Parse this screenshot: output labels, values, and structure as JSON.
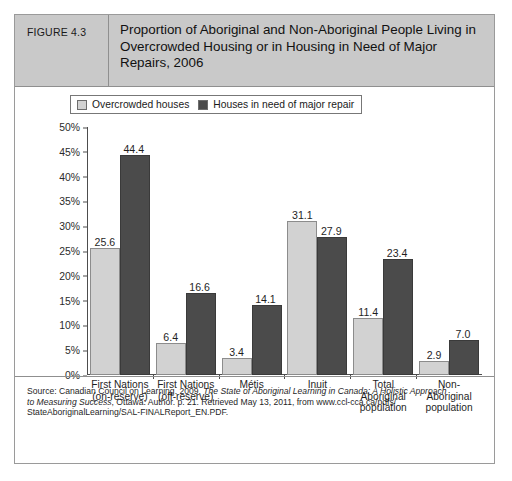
{
  "figure": {
    "number": "FIGURE 4.3",
    "title": "Proportion of Aboriginal and Non-Aboriginal People Living in Overcrowded Housing or in Housing in Need of Major Repairs, 2006"
  },
  "source": {
    "line1_prefix": "Source: Canadian Council on Learning. 2009.",
    "line1_italic": "The State of Aboriginal Learning in Canada: A Holistic Approach",
    "line2_italic": "to Measuring Success",
    "line2_rest": ", Ottawa: Author. p. 21. Retrieved May 13, 2011, from www.ccl-cca.ca/pdfs/",
    "line3": "StateAboriginalLearning/SAL-FINALReport_EN.PDF."
  },
  "colors": {
    "light_bar": "#d2d2d2",
    "dark_bar": "#4b4b4b",
    "header_bg": "#c9c9c9",
    "border": "#9a9a9a",
    "axis": "#4d4d4d"
  },
  "chart_data": {
    "type": "bar",
    "title": "Proportion of Aboriginal and Non-Aboriginal People Living in Overcrowded Housing or in Housing in Need of Major Repairs, 2006",
    "xlabel": "",
    "ylabel": "",
    "ylim": [
      0,
      50
    ],
    "ytick_values": [
      0,
      5,
      10,
      15,
      20,
      25,
      30,
      35,
      40,
      45,
      50
    ],
    "ytick_labels": [
      "0%",
      "5%",
      "10%",
      "15%",
      "20%",
      "25%",
      "30%",
      "35%",
      "40%",
      "45%",
      "50%"
    ],
    "grid": false,
    "legend_position": "top-left",
    "categories": [
      "First Nations (on-reserve)",
      "First Nations (off-reserve)",
      "Métis",
      "Inuit",
      "Total Aboriginal population",
      "Non-Aboriginal population"
    ],
    "category_lines": [
      [
        "First Nations",
        "(on-reserve)"
      ],
      [
        "First Nations",
        "(off-reserve)"
      ],
      [
        "Métis"
      ],
      [
        "Inuit"
      ],
      [
        "Total",
        "Aboriginal",
        "population"
      ],
      [
        "Non-",
        "Aboriginal",
        "population"
      ]
    ],
    "series": [
      {
        "name": "Overcrowded houses",
        "color": "#d2d2d2",
        "values": [
          25.6,
          6.4,
          3.4,
          31.1,
          11.4,
          2.9
        ],
        "labels": [
          "25.6",
          "6.4",
          "3.4",
          "31.1",
          "11.4",
          "2.9"
        ]
      },
      {
        "name": "Houses in need of major repair",
        "color": "#4b4b4b",
        "values": [
          44.4,
          16.6,
          14.1,
          27.9,
          23.4,
          7.0
        ],
        "labels": [
          "44.4",
          "16.6",
          "14.1",
          "27.9",
          "23.4",
          "7.0"
        ]
      }
    ]
  }
}
